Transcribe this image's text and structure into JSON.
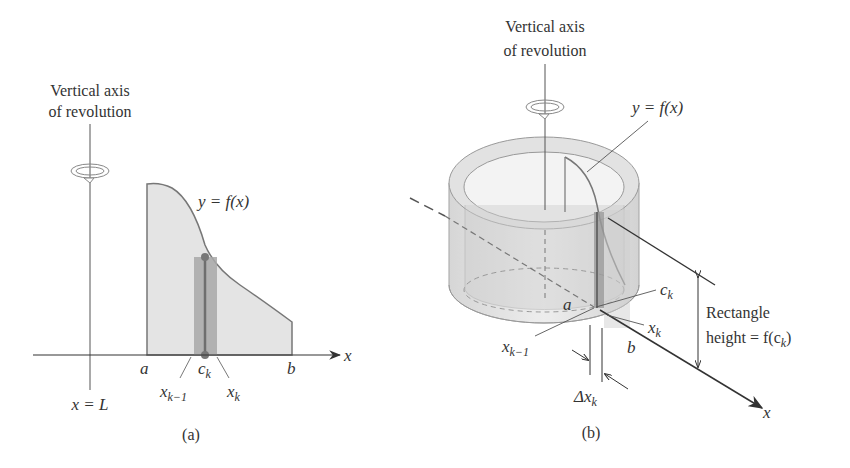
{
  "panel_a": {
    "axis_title_line1": "Vertical axis",
    "axis_title_line2": "of revolution",
    "curve_label": "y = f(x)",
    "axis_x_label": "x",
    "label_a": "a",
    "label_b": "b",
    "label_ck": "c",
    "label_ck_sub": "k",
    "label_xk1": "x",
    "label_xk1_sub": "k−1",
    "label_xk": "x",
    "label_xk_sub": "k",
    "axis_line_label": "x = L",
    "caption": "(a)"
  },
  "panel_b": {
    "axis_title_line1": "Vertical axis",
    "axis_title_line2": "of revolution",
    "curve_label": "y = f(x)",
    "label_ck": "c",
    "label_ck_sub": "k",
    "label_a": "a",
    "label_xk": "x",
    "label_xk_sub": "k",
    "label_xk1": "x",
    "label_xk1_sub": "k−1",
    "label_b": "b",
    "rect_height_line1": "Rectangle",
    "rect_height_line2": "height = f(c",
    "rect_height_sub": "k",
    "rect_height_close": ")",
    "delta_label": "Δx",
    "delta_sub": "k",
    "axis_x_label": "x",
    "caption": "(b)"
  },
  "colors": {
    "region_fill": "#e4e4e4",
    "curve_stroke": "#777777",
    "strip_fill": "#a8a8a8",
    "strip_line": "#6e6e6e",
    "text": "#333333",
    "axis": "#333333",
    "shell_fill": "#d8d8d8"
  }
}
